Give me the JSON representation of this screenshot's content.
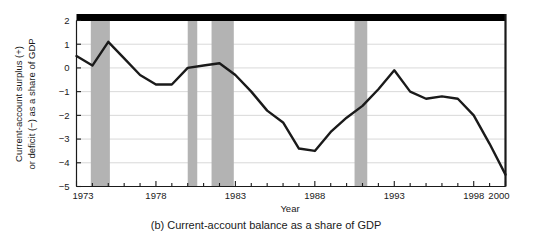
{
  "chart_data": {
    "type": "line",
    "title": "",
    "caption": "(b) Current-account balance as a share of GDP",
    "xlabel": "Year",
    "ylabel_line1": "Current-account surplus (+)",
    "ylabel_line2": "or deficit (−) as a share of GDP",
    "xlim": [
      1973,
      2000
    ],
    "ylim": [
      -5,
      2
    ],
    "xticks": [
      1973,
      1978,
      1983,
      1988,
      1993,
      1998,
      2000
    ],
    "xtick_labels": [
      "1973",
      "1978",
      "1983",
      "1988",
      "1993",
      "1998",
      "2000"
    ],
    "xminor_step": 1,
    "yticks": [
      2,
      1,
      0,
      -1,
      -2,
      -3,
      -4,
      -5
    ],
    "ytick_labels": [
      "2",
      "1",
      "0",
      "−1",
      "−2",
      "−3",
      "−4",
      "−5"
    ],
    "grid": "horizontal",
    "legend": "none",
    "line_color": "#1a1a1a",
    "line_width": 2.4,
    "grid_color": "#d9d9d9",
    "band_color": "#b3b3b3",
    "axis_color": "#1a1a1a",
    "top_bar_color": "#000000",
    "series": [
      {
        "name": "Current-account balance (% of GDP)",
        "x": [
          1973,
          1974,
          1975,
          1976,
          1977,
          1978,
          1979,
          1980,
          1981,
          1982,
          1983,
          1984,
          1985,
          1986,
          1987,
          1988,
          1989,
          1990,
          1991,
          1992,
          1993,
          1994,
          1995,
          1996,
          1997,
          1998,
          1999,
          2000
        ],
        "values": [
          0.5,
          0.1,
          1.1,
          0.4,
          -0.3,
          -0.7,
          -0.7,
          0.0,
          0.1,
          0.2,
          -0.3,
          -1.0,
          -1.8,
          -2.3,
          -3.4,
          -3.5,
          -2.7,
          -2.1,
          -1.6,
          -0.9,
          -0.1,
          -1.0,
          -1.3,
          -1.2,
          -1.3,
          -2.0,
          -3.2,
          -4.5
        ]
      }
    ],
    "recession_bands": [
      {
        "start": 1973.9,
        "end": 1975.1
      },
      {
        "start": 1980.0,
        "end": 1980.6
      },
      {
        "start": 1981.5,
        "end": 1982.9
      },
      {
        "start": 1990.5,
        "end": 1991.3
      }
    ]
  }
}
